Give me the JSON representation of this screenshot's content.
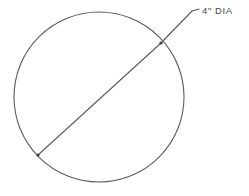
{
  "drawing": {
    "title": "Circle with diameter dimension",
    "background_color": "#ffffff",
    "line_color": "#5a5a5a",
    "text_color": "#4a4a4a",
    "shapes": {
      "circle": {
        "name": "circle-outline",
        "center_x": 99,
        "center_y": 97,
        "radius": 85,
        "stroke_width": 1.1
      },
      "diameter_line": {
        "name": "diameter-line",
        "x1": 38,
        "y1": 155,
        "x2": 161,
        "y2": 43,
        "stroke_width": 1.1
      },
      "leader_line": {
        "name": "leader-line",
        "x1": 161,
        "y1": 43,
        "x2": 192,
        "y2": 11,
        "stroke_width": 1.1
      },
      "leader_tick": {
        "name": "leader-landing-tick",
        "x1": 192,
        "y1": 11,
        "x2": 199,
        "y2": 9,
        "stroke_width": 1.1
      },
      "endpoint_upper": {
        "name": "diameter-endpoint-upper",
        "cx": 161,
        "cy": 43,
        "r": 1.6
      },
      "endpoint_lower": {
        "name": "diameter-endpoint-lower",
        "cx": 38,
        "cy": 155,
        "r": 1.6
      }
    },
    "labels": {
      "dimension": {
        "name": "dimension-label",
        "text": "4\" DIA",
        "x": 202,
        "y": 14
      }
    }
  }
}
